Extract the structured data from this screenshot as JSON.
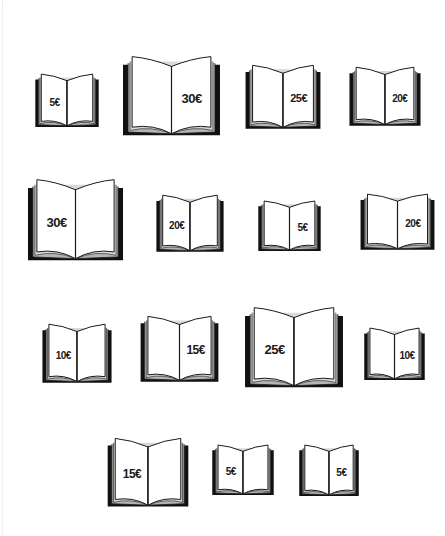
{
  "page": {
    "currency_symbol": "€"
  },
  "books": [
    {
      "id": 1,
      "price": "5€",
      "value": 5,
      "page": "left",
      "row": 1,
      "x": 34,
      "y": 73,
      "w": 66,
      "h": 55
    },
    {
      "id": 2,
      "price": "30€",
      "value": 30,
      "page": "right",
      "row": 1,
      "x": 121,
      "y": 55,
      "w": 101,
      "h": 82
    },
    {
      "id": 3,
      "price": "25€",
      "value": 25,
      "page": "right",
      "row": 1,
      "x": 244,
      "y": 64,
      "w": 78,
      "h": 66
    },
    {
      "id": 4,
      "price": "20€",
      "value": 20,
      "page": "right",
      "row": 1,
      "x": 348,
      "y": 66,
      "w": 74,
      "h": 61
    },
    {
      "id": 5,
      "price": "30€",
      "value": 30,
      "page": "left",
      "row": 2,
      "x": 26,
      "y": 178,
      "w": 99,
      "h": 84
    },
    {
      "id": 6,
      "price": "20€",
      "value": 20,
      "page": "left",
      "row": 2,
      "x": 155,
      "y": 194,
      "w": 70,
      "h": 59
    },
    {
      "id": 7,
      "price": "5€",
      "value": 5,
      "page": "right",
      "row": 2,
      "x": 257,
      "y": 200,
      "w": 65,
      "h": 52
    },
    {
      "id": 8,
      "price": "20€",
      "value": 20,
      "page": "right",
      "row": 2,
      "x": 359,
      "y": 193,
      "w": 77,
      "h": 58
    },
    {
      "id": 9,
      "price": "10€",
      "value": 10,
      "page": "left",
      "row": 3,
      "x": 41,
      "y": 323,
      "w": 72,
      "h": 61
    },
    {
      "id": 10,
      "price": "15€",
      "value": 15,
      "page": "right",
      "row": 3,
      "x": 139,
      "y": 315,
      "w": 81,
      "h": 68
    },
    {
      "id": 11,
      "price": "25€",
      "value": 25,
      "page": "left",
      "row": 3,
      "x": 243,
      "y": 306,
      "w": 102,
      "h": 83
    },
    {
      "id": 12,
      "price": "10€",
      "value": 10,
      "page": "right",
      "row": 3,
      "x": 363,
      "y": 327,
      "w": 63,
      "h": 54
    },
    {
      "id": 13,
      "price": "15€",
      "value": 15,
      "page": "left",
      "row": 4,
      "x": 106,
      "y": 437,
      "w": 84,
      "h": 71
    },
    {
      "id": 14,
      "price": "5€",
      "value": 5,
      "page": "left",
      "row": 4,
      "x": 211,
      "y": 444,
      "w": 64,
      "h": 52
    },
    {
      "id": 15,
      "price": "5€",
      "value": 5,
      "page": "right",
      "row": 4,
      "x": 298,
      "y": 444,
      "w": 62,
      "h": 53
    }
  ],
  "colors": {
    "ink": "#1a1a1a",
    "cover": "#111111",
    "page": "#ffffff",
    "page_edge": "#b5b5b5",
    "background": "#ffffff"
  }
}
